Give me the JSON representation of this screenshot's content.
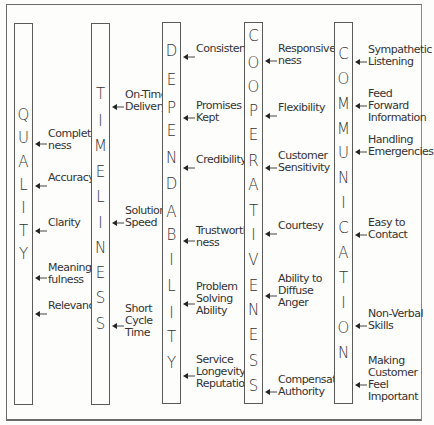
{
  "diagram": {
    "columns": [
      {
        "title": "QUALITY",
        "letters": [
          "Q",
          "U",
          "A",
          "L",
          "I",
          "T",
          "Y"
        ],
        "bar": {
          "x": 14,
          "top": 23,
          "bottom": 405
        },
        "letter_y": [
          114,
          137,
          161,
          184,
          207,
          230,
          253
        ],
        "items": [
          {
            "label": "Complete-\nness",
            "arrow_y": 136,
            "label_top": 128
          },
          {
            "label": "Accuracy",
            "arrow_y": 178,
            "label_top": 172
          },
          {
            "label": "Clarity",
            "arrow_y": 223,
            "label_top": 217
          },
          {
            "label": "Meaning-\nfulness",
            "arrow_y": 270,
            "label_top": 262
          },
          {
            "label": "Relevancy",
            "arrow_y": 306,
            "label_top": 300
          }
        ]
      },
      {
        "title": "TIMELINESS",
        "letters": [
          "T",
          "I",
          "M",
          "E",
          "L",
          "I",
          "N",
          "E",
          "S",
          "S"
        ],
        "bar": {
          "x": 91,
          "top": 23,
          "bottom": 405
        },
        "letter_y": [
          93,
          120,
          145,
          171,
          196,
          222,
          247,
          272,
          297,
          323
        ],
        "items": [
          {
            "label": "On-Time\nDelivery",
            "arrow_y": 99,
            "label_top": 89
          },
          {
            "label": "Solution\nSpeed",
            "arrow_y": 215,
            "label_top": 205
          },
          {
            "label": "Short\nCycle\nTime",
            "arrow_y": 318,
            "label_top": 303
          }
        ]
      },
      {
        "title": "DEPENDABILITY",
        "letters": [
          "D",
          "E",
          "P",
          "E",
          "N",
          "D",
          "A",
          "B",
          "I",
          "L",
          "I",
          "T",
          "Y"
        ],
        "bar": {
          "x": 162,
          "top": 22,
          "bottom": 404
        },
        "letter_y": [
          50,
          79,
          107,
          130,
          157,
          183,
          211,
          234,
          259,
          285,
          312,
          336,
          362
        ],
        "items": [
          {
            "label": "Consistency",
            "arrow_y": 49,
            "label_top": 43
          },
          {
            "label": "Promises\nKept",
            "arrow_y": 110,
            "label_top": 100
          },
          {
            "label": "Credibility",
            "arrow_y": 160,
            "label_top": 154
          },
          {
            "label": "Trustworthi-\nness",
            "arrow_y": 233,
            "label_top": 225
          },
          {
            "label": "Problem\nSolving\nAbility",
            "arrow_y": 296,
            "label_top": 281
          },
          {
            "label": "Service\nLongevity/\nReputation",
            "arrow_y": 368,
            "label_top": 354
          }
        ]
      },
      {
        "title": "COOPERATIVENESS",
        "letters": [
          "C",
          "O",
          "O",
          "P",
          "E",
          "R",
          "A",
          "T",
          "I",
          "V",
          "E",
          "N",
          "E",
          "S",
          "S"
        ],
        "bar": {
          "x": 244,
          "top": 22,
          "bottom": 404
        },
        "letter_y": [
          35,
          62,
          86,
          110,
          134,
          160,
          184,
          210,
          234,
          259,
          285,
          309,
          334,
          360,
          385
        ],
        "items": [
          {
            "label": "Responsive-\nness",
            "arrow_y": 53,
            "label_top": 43
          },
          {
            "label": "Flexibility",
            "arrow_y": 108,
            "label_top": 102
          },
          {
            "label": "Customer\nSensitivity",
            "arrow_y": 160,
            "label_top": 150
          },
          {
            "label": "Courtesy",
            "arrow_y": 226,
            "label_top": 220
          },
          {
            "label": "Ability to\nDiffuse\nAnger",
            "arrow_y": 288,
            "label_top": 273
          },
          {
            "label": "Compensation\nAuthority",
            "arrow_y": 384,
            "label_top": 374
          }
        ]
      },
      {
        "title": "COMMUNICATION",
        "letters": [
          "C",
          "O",
          "M",
          "M",
          "U",
          "N",
          "I",
          "C",
          "A",
          "T",
          "I",
          "O",
          "N"
        ],
        "bar": {
          "x": 334,
          "top": 22,
          "bottom": 404
        },
        "letter_y": [
          53,
          78,
          103,
          128,
          152,
          177,
          202,
          227,
          252,
          277,
          302,
          327,
          352
        ],
        "items": [
          {
            "label": "Sympathetic\nListening",
            "arrow_y": 54,
            "label_top": 44
          },
          {
            "label": "Feed Forward\nInformation",
            "arrow_y": 98,
            "label_top": 88
          },
          {
            "label": "Handling\nEmergencies",
            "arrow_y": 144,
            "label_top": 134
          },
          {
            "label": "Easy to\nContact",
            "arrow_y": 227,
            "label_top": 217
          },
          {
            "label": "Non-Verbal\nSkills",
            "arrow_y": 318,
            "label_top": 308
          },
          {
            "label": "Making\nCustomer\nFeel\nImportant",
            "arrow_y": 377,
            "label_top": 355
          }
        ]
      }
    ]
  }
}
